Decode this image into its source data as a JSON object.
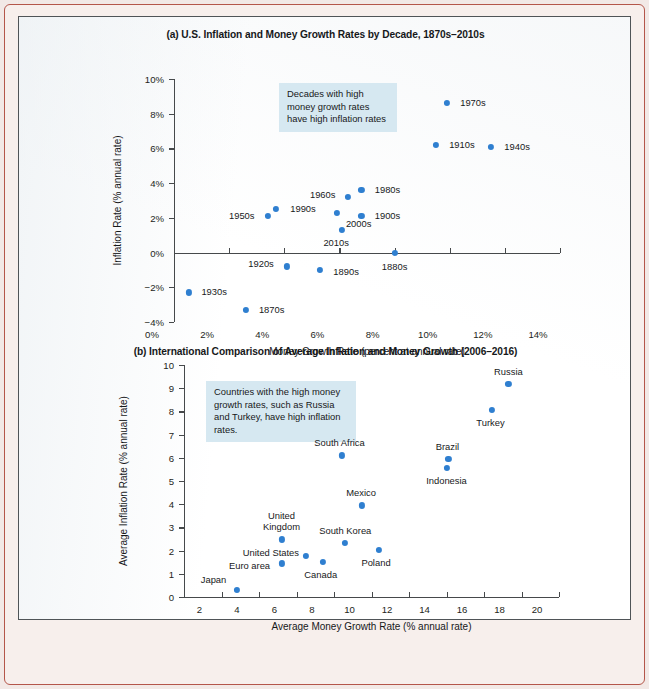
{
  "figure": {
    "accent_color": "#2f7fd0",
    "annotation_bg": "#d6e8f1",
    "frame_color": "#b4564a"
  },
  "chart_data": [
    {
      "type": "scatter",
      "panel": "a",
      "title": "(a) U.S. Inflation and Money Growth Rates by Decade, 1870s–2010s",
      "xlabel": "Money Growth Rate (percent at annual rate)",
      "ylabel": "Inflation Rate (% annual rate)",
      "xlim": [
        0,
        14
      ],
      "ylim": [
        -4,
        10
      ],
      "xticks": [
        "0%",
        "2%",
        "4%",
        "6%",
        "8%",
        "10%",
        "12%",
        "14%"
      ],
      "xtickvals": [
        0,
        2,
        4,
        6,
        8,
        10,
        12,
        14
      ],
      "yticks": [
        "10%",
        "8%",
        "6%",
        "4%",
        "2%",
        "0%",
        "−2%",
        "−4%"
      ],
      "ytickvals": [
        10,
        8,
        6,
        4,
        2,
        0,
        -2,
        -4
      ],
      "grid": false,
      "legend": "none",
      "annotation": "Decades with high money growth rates have high inflation rates",
      "points": [
        {
          "label": "1870s",
          "x": 2.6,
          "y": -3.3,
          "label_dx": 26,
          "label_dy": 0
        },
        {
          "label": "1880s",
          "x": 8.0,
          "y": 0.0,
          "label_dx": 0,
          "label_dy": 14
        },
        {
          "label": "1890s",
          "x": 5.3,
          "y": -1.0,
          "label_dx": 26,
          "label_dy": 2
        },
        {
          "label": "1900s",
          "x": 6.8,
          "y": 2.1,
          "label_dx": 26,
          "label_dy": 0
        },
        {
          "label": "1910s",
          "x": 9.5,
          "y": 6.2,
          "label_dx": 26,
          "label_dy": 0
        },
        {
          "label": "1920s",
          "x": 4.1,
          "y": -0.8,
          "label_dx": -26,
          "label_dy": -2
        },
        {
          "label": "1930s",
          "x": 0.55,
          "y": -2.3,
          "label_dx": 25,
          "label_dy": 0
        },
        {
          "label": "1940s",
          "x": 11.5,
          "y": 6.1,
          "label_dx": 26,
          "label_dy": 0
        },
        {
          "label": "1950s",
          "x": 3.4,
          "y": 2.1,
          "label_dx": -26,
          "label_dy": 0
        },
        {
          "label": "1960s",
          "x": 6.3,
          "y": 3.2,
          "label_dx": -25,
          "label_dy": -2
        },
        {
          "label": "1970s",
          "x": 9.9,
          "y": 8.6,
          "label_dx": 26,
          "label_dy": 0
        },
        {
          "label": "1980s",
          "x": 6.8,
          "y": 3.6,
          "label_dx": 26,
          "label_dy": 0
        },
        {
          "label": "1990s",
          "x": 3.7,
          "y": 2.5,
          "label_dx": 27,
          "label_dy": 0
        },
        {
          "label": "2000s",
          "x": 5.9,
          "y": 2.3,
          "label_dx": 22,
          "label_dy": 11
        },
        {
          "label": "2010s",
          "x": 6.1,
          "y": 1.3,
          "label_dx": -6,
          "label_dy": 13
        }
      ]
    },
    {
      "type": "scatter",
      "panel": "b",
      "title": "(b) International Comparison of Average Inflation and Money Growth (2006–2016)",
      "xlabel": "Average Money Growth Rate (% annual rate)",
      "ylabel": "Average Inflation Rate (% annual rate)",
      "xlim": [
        0,
        20
      ],
      "ylim": [
        0,
        10
      ],
      "xticks": [
        "2",
        "4",
        "6",
        "8",
        "10",
        "12",
        "14",
        "16",
        "18",
        "20"
      ],
      "xtickvals": [
        2,
        4,
        6,
        8,
        10,
        12,
        14,
        16,
        18,
        20
      ],
      "yticks": [
        "10",
        "9",
        "8",
        "7",
        "6",
        "5",
        "4",
        "3",
        "2",
        "1",
        "0"
      ],
      "ytickvals": [
        10,
        9,
        8,
        7,
        6,
        5,
        4,
        3,
        2,
        1,
        0
      ],
      "grid": false,
      "legend": "none",
      "annotation": "Countries with the high money growth rates, such as Russia and Turkey, have high inflation rates.",
      "points": [
        {
          "label": "Japan",
          "x": 2.8,
          "y": 0.3,
          "label_dx": -23,
          "label_dy": -10
        },
        {
          "label": "Euro area",
          "x": 5.2,
          "y": 1.45,
          "label_dx": -32,
          "label_dy": 3
        },
        {
          "label": "United States",
          "x": 6.5,
          "y": 1.77,
          "label_dx": -35,
          "label_dy": -3
        },
        {
          "label": "Canada",
          "x": 7.4,
          "y": 1.52,
          "label_dx": -2,
          "label_dy": 13
        },
        {
          "label": "United\nKingdom",
          "x": 5.2,
          "y": 2.48,
          "label_dx": 0,
          "label_dy": -18
        },
        {
          "label": "South Korea",
          "x": 8.6,
          "y": 2.33,
          "label_dx": 0,
          "label_dy": -12
        },
        {
          "label": "Poland",
          "x": 10.4,
          "y": 2.03,
          "label_dx": -3,
          "label_dy": 13
        },
        {
          "label": "Mexico",
          "x": 9.5,
          "y": 3.95,
          "label_dx": -1,
          "label_dy": -12
        },
        {
          "label": "South Africa",
          "x": 8.4,
          "y": 6.1,
          "label_dx": -2,
          "label_dy": -12
        },
        {
          "label": "Brazil",
          "x": 14.1,
          "y": 5.95,
          "label_dx": -1,
          "label_dy": -12
        },
        {
          "label": "Indonesia",
          "x": 14.0,
          "y": 5.55,
          "label_dx": 0,
          "label_dy": 13
        },
        {
          "label": "Turkey",
          "x": 16.4,
          "y": 8.05,
          "label_dx": -1,
          "label_dy": 13
        },
        {
          "label": "Russia",
          "x": 17.3,
          "y": 9.2,
          "label_dx": 0,
          "label_dy": -12
        }
      ]
    }
  ]
}
